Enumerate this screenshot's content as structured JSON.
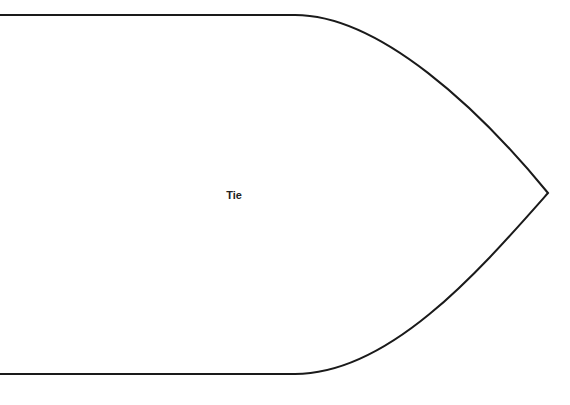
{
  "diagram": {
    "shape": "pentagon-arrow",
    "label": "Tie",
    "stroke_color": "#1a1a1a",
    "fill_color": "#ffffff"
  }
}
